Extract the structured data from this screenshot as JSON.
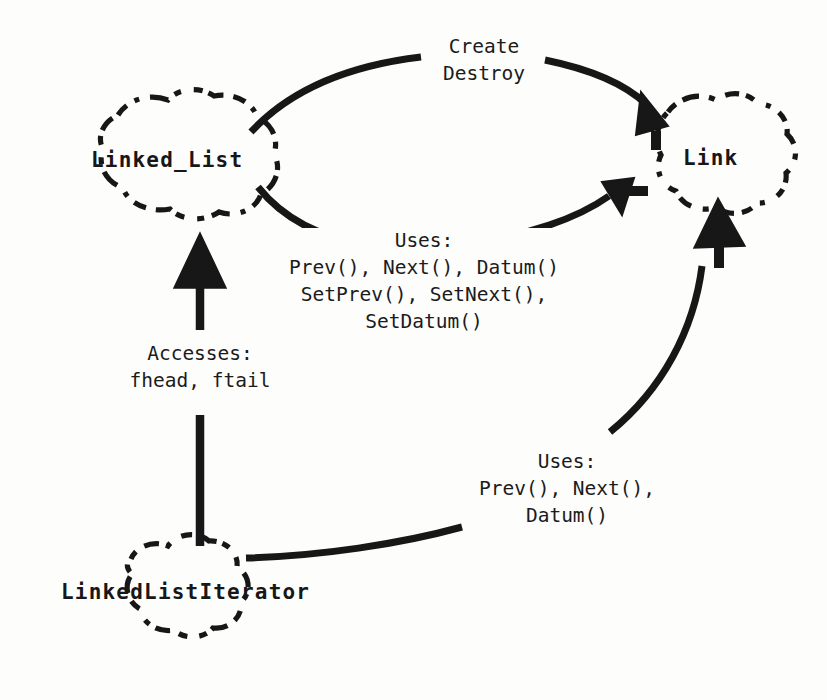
{
  "diagram": {
    "notation": "booch-class-diagram",
    "background_color": "#fdfdfc",
    "ink_color": "#171717",
    "classes": [
      {
        "id": "linked-list",
        "name": "Linked_List",
        "cx": 186,
        "cy": 160,
        "rx": 96,
        "ry": 62
      },
      {
        "id": "link",
        "name": "Link",
        "cx": 721,
        "cy": 158,
        "rx": 78,
        "ry": 62
      },
      {
        "id": "linked-list-iterator",
        "name": "LinkedListIterator",
        "cx": 198,
        "cy": 592,
        "rx": 80,
        "ry": 50
      }
    ],
    "relationships": [
      {
        "id": "create-destroy",
        "from": "linked-list",
        "to": "link",
        "label_lines": [
          "Create",
          "Destroy"
        ],
        "label_x": 483,
        "label_y": 36,
        "arrow": "filled-triangle"
      },
      {
        "id": "list-uses-link",
        "from": "linked-list",
        "to": "link",
        "label_lines": [
          "Uses:",
          "Prev(), Next(), Datum()",
          "SetPrev(), SetNext(),",
          "SetDatum()"
        ],
        "label_x": 424,
        "label_y": 229,
        "arrow": "filled-triangle"
      },
      {
        "id": "iterator-accesses-list",
        "from": "linked-list-iterator",
        "to": "linked-list",
        "label_lines": [
          "Accesses:",
          "fhead, ftail"
        ],
        "label_x": 200,
        "label_y": 345,
        "arrow": "filled-triangle"
      },
      {
        "id": "iterator-uses-link",
        "from": "linked-list-iterator",
        "to": "link",
        "label_lines": [
          "Uses:",
          "Prev(), Next(),",
          "Datum()"
        ],
        "label_x": 567,
        "label_y": 452,
        "arrow": "filled-triangle"
      }
    ]
  }
}
